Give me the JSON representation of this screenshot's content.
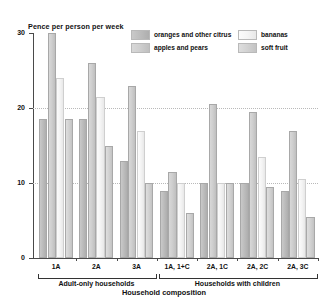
{
  "chart_data": {
    "type": "bar",
    "title": "",
    "ylabel": "Pence per person per week",
    "xlabel": "Household composition",
    "ylim": [
      0,
      30
    ],
    "yticks": [
      0,
      10,
      20,
      30
    ],
    "ytick_labels": [
      "0",
      "10",
      "20",
      "30"
    ],
    "grid": "horizontal dotted at 10 and 20",
    "legend_position": "top-right",
    "categories": [
      "1A",
      "2A",
      "3A",
      "1A, 1+C",
      "2A, 1C",
      "2A, 2C",
      "2A, 3C"
    ],
    "series": [
      {
        "name": "oranges and other citrus",
        "color": "#bdbdbd",
        "values": [
          18.5,
          18.5,
          13.0,
          9.0,
          10.0,
          10.0,
          9.0
        ]
      },
      {
        "name": "apples and pears",
        "color": "#cfcfcf",
        "values": [
          30.0,
          26.0,
          23.0,
          11.5,
          20.5,
          19.5,
          17.0
        ]
      },
      {
        "name": "bananas",
        "color": "#f4f4f4",
        "values": [
          24.0,
          21.5,
          17.0,
          10.0,
          10.0,
          13.5,
          10.5
        ]
      },
      {
        "name": "soft fruit",
        "color": "#d3d3d3",
        "values": [
          18.5,
          15.0,
          10.0,
          6.0,
          10.0,
          9.5,
          5.5
        ]
      }
    ],
    "group_brackets": [
      {
        "label": "Adult-only households",
        "categories": [
          "1A",
          "2A",
          "3A"
        ]
      },
      {
        "label": "Households with children",
        "categories": [
          "1A, 1+C",
          "2A, 1C",
          "2A, 2C",
          "2A, 3C"
        ]
      }
    ]
  },
  "axes": {
    "y_title": "Pence per person per week",
    "x_title": "Household composition",
    "y_labels": [
      "0",
      "10",
      "20",
      "30"
    ],
    "x_labels": [
      "1A",
      "2A",
      "3A",
      "1A, 1+C",
      "2A, 1C",
      "2A, 2C",
      "2A, 3C"
    ]
  },
  "legend": {
    "items": [
      {
        "label": "oranges and other citrus"
      },
      {
        "label": "apples and pears"
      },
      {
        "label": "bananas"
      },
      {
        "label": "soft fruit"
      }
    ]
  },
  "brackets": {
    "adult_only": "Adult-only households",
    "with_children": "Households with children"
  }
}
